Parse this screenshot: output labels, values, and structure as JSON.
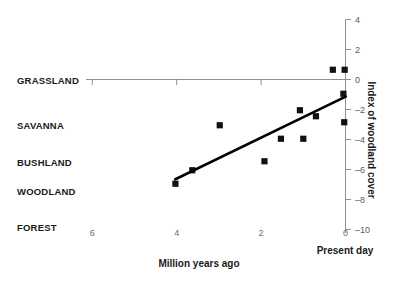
{
  "chart_data": {
    "type": "scatter",
    "title": "",
    "xlabel": "Million years ago",
    "ylabel": "Index of woodland cover",
    "x_note": "Present day",
    "xlim": [
      6.6,
      -0.25
    ],
    "ylim": [
      -10.8,
      4.6
    ],
    "xticks": [
      6,
      4,
      2,
      0
    ],
    "xtick_labels": [
      "6",
      "4",
      "2",
      "0"
    ],
    "yticks": [
      4,
      2,
      0,
      -2,
      -4,
      -6,
      -8,
      -10
    ],
    "ytick_labels": [
      "4",
      "2",
      "0",
      "–2",
      "–4",
      "–6",
      "–8",
      "–10"
    ],
    "grid": false,
    "legend": "none",
    "zero_line": 0,
    "category_axis": {
      "name": "vegetation-type",
      "labels": [
        "GRASSLAND",
        "SAVANNA",
        "BUSHLAND",
        "WOODLAND",
        "FOREST"
      ],
      "values": [
        0,
        -3,
        -5.5,
        -7.4,
        -9.8
      ]
    },
    "series": [
      {
        "name": "Woodland cover index",
        "marker": "square",
        "color": "#111111",
        "points": [
          {
            "x": 4.03,
            "y": -6.95
          },
          {
            "x": 3.63,
            "y": -6.05
          },
          {
            "x": 2.98,
            "y": -3.05
          },
          {
            "x": 1.53,
            "y": -3.95
          },
          {
            "x": 1.92,
            "y": -5.45
          },
          {
            "x": 1.0,
            "y": -3.95
          },
          {
            "x": 1.08,
            "y": -2.05
          },
          {
            "x": 0.7,
            "y": -2.45
          },
          {
            "x": 0.3,
            "y": 0.65
          },
          {
            "x": 0.02,
            "y": 0.65
          },
          {
            "x": 0.05,
            "y": -0.95
          },
          {
            "x": 0.03,
            "y": -2.85
          }
        ]
      }
    ],
    "trend_line": {
      "name": "regression-line",
      "color": "#000000",
      "x_start": 4.03,
      "y_start": -6.65,
      "x_end": 0.0,
      "y_end": -1.15
    }
  }
}
